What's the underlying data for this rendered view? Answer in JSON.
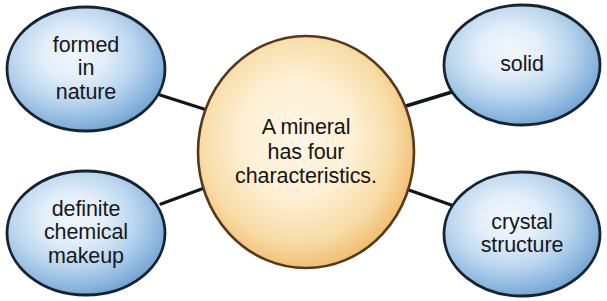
{
  "diagram": {
    "type": "hub-and-spoke concept map",
    "title_text": "A mineral\nhas four\ncharacteristics.",
    "center": {
      "id": "center-node",
      "name": "center-node-mineral",
      "text": "A mineral\nhas four\ncharacteristics.",
      "shape": "ellipse",
      "cx": 306,
      "cy": 152,
      "rx": 108,
      "ry": 116,
      "fill_edge": "#efb464",
      "fill_center": "#fdf2d9",
      "stroke": "#57381a",
      "stroke_width": 2.6
    },
    "satellites": [
      {
        "id": "node-formed-in-nature",
        "name": "node-formed-in-nature",
        "text": "formed\nin\nnature",
        "position": "top-left",
        "cx": 86,
        "cy": 69,
        "rx": 79,
        "ry": 62
      },
      {
        "id": "node-solid",
        "name": "node-solid",
        "text": "solid",
        "position": "top-right",
        "cx": 522,
        "cy": 65,
        "rx": 78,
        "ry": 60
      },
      {
        "id": "node-definite-chemical-makeup",
        "name": "node-definite-chemical-makeup",
        "text": "definite\nchemical\nmakeup",
        "position": "bottom-left",
        "cx": 86,
        "cy": 233,
        "rx": 79,
        "ry": 62
      },
      {
        "id": "node-crystal-structure",
        "name": "node-crystal-structure",
        "text": "crystal\nstructure",
        "position": "bottom-right",
        "cx": 522,
        "cy": 234,
        "rx": 78,
        "ry": 62
      }
    ],
    "connectors": [
      {
        "id": "connector-top-left",
        "name": "connector-center-to-formed-in-nature",
        "x1": 160,
        "y1": 95,
        "x2": 207,
        "y2": 110
      },
      {
        "id": "connector-bottom-left",
        "name": "connector-center-to-definite-chemical-makeup",
        "x1": 161,
        "y1": 204,
        "x2": 207,
        "y2": 187
      },
      {
        "id": "connector-top-right",
        "name": "connector-center-to-solid",
        "x1": 406,
        "y1": 106,
        "x2": 452,
        "y2": 92
      },
      {
        "id": "connector-bottom-right",
        "name": "connector-center-to-crystal-structure",
        "x1": 406,
        "y1": 189,
        "x2": 454,
        "y2": 206
      }
    ],
    "colors": {
      "satellite_fill_edge": "#79a7d6",
      "satellite_fill_mid": "#b6d2ec",
      "satellite_fill_center": "#e9f2fa",
      "satellite_stroke": "#17232e",
      "center_fill_edge": "#efb464",
      "center_fill_center": "#fdf2d9",
      "center_stroke": "#57381a",
      "connector_stroke": "#13161b",
      "text_color": "#16181c",
      "background": "#ffffff"
    }
  }
}
